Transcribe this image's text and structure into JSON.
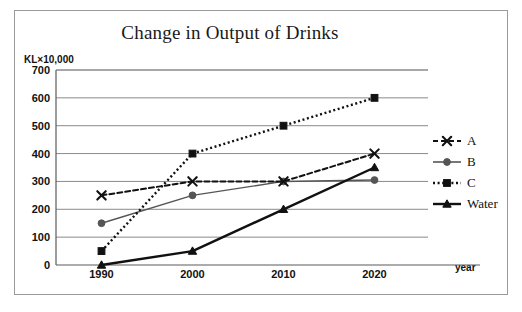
{
  "figure": {
    "title": "Change in Output of Drinks",
    "y_unit_label": "KL×10,000",
    "x_axis_label": "year"
  },
  "chart_data": {
    "type": "line",
    "title": "Change in Output of Drinks",
    "xlabel": "year",
    "ylabel": "KL×10,000",
    "categories": [
      "1990",
      "2000",
      "2010",
      "2020"
    ],
    "x": [
      1990,
      2000,
      2010,
      2020
    ],
    "ylim": [
      0,
      700
    ],
    "ytick_labels": [
      "0",
      "100",
      "200",
      "300",
      "400",
      "500",
      "600",
      "700"
    ],
    "yticks": [
      0,
      100,
      200,
      300,
      400,
      500,
      600,
      700
    ],
    "grid": true,
    "legend_position": "right",
    "series": [
      {
        "name": "A",
        "values": [
          250,
          300,
          300,
          400
        ],
        "line_style": "dashed",
        "marker": "x",
        "color": "#111111"
      },
      {
        "name": "B",
        "values": [
          150,
          250,
          300,
          305
        ],
        "line_style": "solid",
        "marker": "circle",
        "color": "#555555"
      },
      {
        "name": "C",
        "values": [
          50,
          400,
          500,
          600
        ],
        "line_style": "dotted",
        "marker": "square",
        "color": "#111111"
      },
      {
        "name": "Water",
        "values": [
          0,
          50,
          200,
          350
        ],
        "line_style": "solid",
        "marker": "triangle",
        "color": "#111111"
      }
    ]
  },
  "legend": {
    "items": [
      {
        "label": "A"
      },
      {
        "label": "B"
      },
      {
        "label": "C"
      },
      {
        "label": "Water"
      }
    ]
  }
}
